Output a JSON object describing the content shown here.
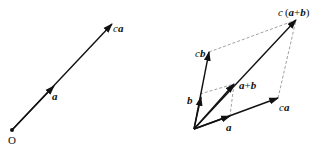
{
  "left_diagram": {
    "origin_label": "O",
    "vector_a_label": "a",
    "vector_ca_label_scalar": "c",
    "vector_ca_label_vector": "a"
  },
  "right_diagram": {
    "a_label": "a",
    "b_label": "b",
    "ca_scalar": "c",
    "ca_vector": "a",
    "cb_scalar": "c",
    "cb_vector": "b",
    "a_plus_b": {
      "a": "a",
      "plus": "+",
      "b": "b"
    },
    "c_a_plus_b": {
      "c": "c",
      "open": "(",
      "a": "a",
      "plus": "+",
      "b": "b",
      "close": ")"
    }
  },
  "colors": {
    "line": "#111111",
    "dashed": "#888888"
  }
}
